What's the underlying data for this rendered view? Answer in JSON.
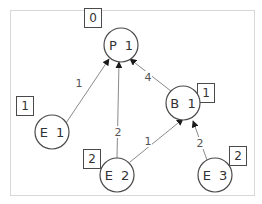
{
  "diagram": {
    "type": "directed-weighted-graph",
    "colors": {
      "frame": "#d8d8d8",
      "edge": "#8a8a8a",
      "node_stroke": "#4a4a4a",
      "text": "#333333"
    },
    "nodes": [
      {
        "id": "P1",
        "label": "P 1",
        "badge": "0"
      },
      {
        "id": "E1",
        "label": "E 1",
        "badge": "1"
      },
      {
        "id": "B1",
        "label": "B 1",
        "badge": "1"
      },
      {
        "id": "E2",
        "label": "E 2",
        "badge": "2"
      },
      {
        "id": "E3",
        "label": "E 3",
        "badge": "2"
      }
    ],
    "edges": [
      {
        "from": "E1",
        "to": "P1",
        "weight": "1"
      },
      {
        "from": "E2",
        "to": "P1",
        "weight": "2"
      },
      {
        "from": "B1",
        "to": "P1",
        "weight": "4"
      },
      {
        "from": "E2",
        "to": "B1",
        "weight": "1"
      },
      {
        "from": "E3",
        "to": "B1",
        "weight": "2"
      }
    ]
  }
}
